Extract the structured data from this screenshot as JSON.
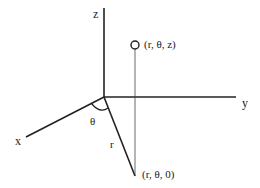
{
  "diagram": {
    "axes": {
      "x_label": "x",
      "y_label": "y",
      "z_label": "z"
    },
    "point_label": "(r, θ, z)",
    "projection_label": "(r, θ, 0)",
    "angle_label": "θ",
    "radius_label": "r",
    "colors": {
      "stroke": "#222222",
      "background": "#ffffff"
    }
  }
}
